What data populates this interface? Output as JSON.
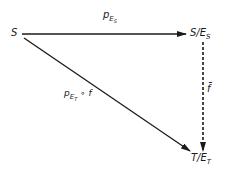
{
  "diagram": {
    "nodes": {
      "source": {
        "label": "S"
      },
      "quotient_s": {
        "base": "S/E",
        "sub": "S"
      },
      "quotient_t": {
        "base": "T/E",
        "sub": "T"
      }
    },
    "arrows": {
      "top": {
        "label_base": "p",
        "label_sub": "E",
        "label_subsub": "S",
        "style": "solid"
      },
      "diagonal": {
        "label_base": "p",
        "label_sub": "E",
        "label_subsub": "T",
        "label_tail": " ∘ f",
        "style": "solid"
      },
      "right": {
        "label": "f̄",
        "style": "dashed"
      }
    },
    "colors": {
      "stroke": "#1a1a1a",
      "background": "#ffffff"
    }
  }
}
